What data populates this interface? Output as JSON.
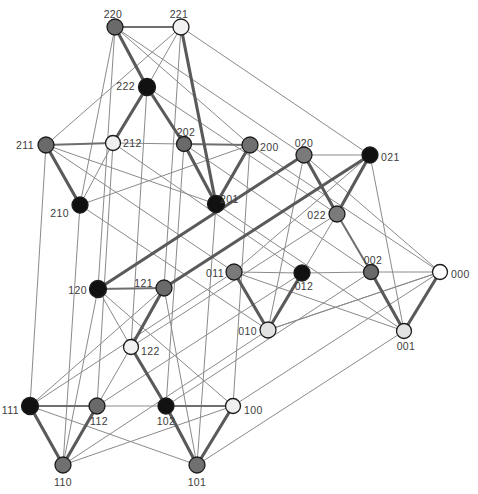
{
  "figure": {
    "width": 478,
    "height": 494,
    "background": "#ffffff"
  },
  "style": {
    "edge_strong_color": "#5a5a5a",
    "edge_medium_color": "#6e6e6e",
    "edge_thin_color": "#8a8a8a",
    "node_stroke": "#1c1c1c",
    "label_color": "#3c3c3c",
    "palette": {
      "black": "#111111",
      "dark_gray": "#6a6a6a",
      "mid_gray": "#909090",
      "light_gray": "#dcdcdc",
      "white": "#ffffff"
    }
  },
  "chart_data": {
    "type": "diagram",
    "subtype": "node-link-graph",
    "node_count": 27,
    "edge_count": 81,
    "label_scheme": "ternary-3-digit",
    "edge_rule": "vertices adjacent when labels differ in exactly one digit",
    "nodes": [
      {
        "id": "220",
        "label": "220",
        "x": 115,
        "y": 27,
        "r": 8.0,
        "fill": "#6a6a6a",
        "label_dx": -2,
        "label_dy": -12,
        "anchor": "middle"
      },
      {
        "id": "221",
        "label": "221",
        "x": 181,
        "y": 27,
        "r": 8.0,
        "fill": "#f2f2f2",
        "label_dx": -2,
        "label_dy": -12,
        "anchor": "middle"
      },
      {
        "id": "222",
        "label": "222",
        "x": 147,
        "y": 87,
        "r": 8.5,
        "fill": "#111111",
        "label_dx": -12,
        "label_dy": 0,
        "anchor": "end"
      },
      {
        "id": "211",
        "label": "211",
        "x": 46,
        "y": 145,
        "r": 8.0,
        "fill": "#6a6a6a",
        "label_dx": -12,
        "label_dy": 1,
        "anchor": "end"
      },
      {
        "id": "212",
        "label": "212",
        "x": 113,
        "y": 143,
        "r": 7.5,
        "fill": "#efefef",
        "label_dx": 10,
        "label_dy": 1,
        "anchor": "start"
      },
      {
        "id": "202",
        "label": "202",
        "x": 184,
        "y": 144,
        "r": 7.5,
        "fill": "#6a6a6a",
        "label_dx": 2,
        "label_dy": -11,
        "anchor": "middle"
      },
      {
        "id": "200",
        "label": "200",
        "x": 250,
        "y": 145,
        "r": 8.0,
        "fill": "#707070",
        "label_dx": 10,
        "label_dy": 3,
        "anchor": "start"
      },
      {
        "id": "020",
        "label": "020",
        "x": 304,
        "y": 155,
        "r": 8.0,
        "fill": "#7a7a7a",
        "label_dx": 0,
        "label_dy": -11,
        "anchor": "middle"
      },
      {
        "id": "021",
        "label": "021",
        "x": 370,
        "y": 155,
        "r": 8.0,
        "fill": "#111111",
        "label_dx": 11,
        "label_dy": 3,
        "anchor": "start"
      },
      {
        "id": "210",
        "label": "210",
        "x": 80,
        "y": 205,
        "r": 8.0,
        "fill": "#111111",
        "label_dx": -11,
        "label_dy": 9,
        "anchor": "end"
      },
      {
        "id": "201",
        "label": "201",
        "x": 216,
        "y": 204,
        "r": 8.5,
        "fill": "#111111",
        "label_dx": 4,
        "label_dy": -4,
        "anchor": "start"
      },
      {
        "id": "022",
        "label": "022",
        "x": 337,
        "y": 214,
        "r": 8.0,
        "fill": "#7a7a7a",
        "label_dx": -11,
        "label_dy": 2,
        "anchor": "end"
      },
      {
        "id": "011",
        "label": "011",
        "x": 234,
        "y": 272,
        "r": 8.0,
        "fill": "#7a7a7a",
        "label_dx": -10,
        "label_dy": 2,
        "anchor": "end"
      },
      {
        "id": "012",
        "label": "012",
        "x": 302,
        "y": 273,
        "r": 8.0,
        "fill": "#111111",
        "label_dx": 2,
        "label_dy": 14,
        "anchor": "middle"
      },
      {
        "id": "002",
        "label": "002",
        "x": 371,
        "y": 272,
        "r": 7.5,
        "fill": "#6a6a6a",
        "label_dx": 2,
        "label_dy": -11,
        "anchor": "middle"
      },
      {
        "id": "000",
        "label": "000",
        "x": 440,
        "y": 272,
        "r": 7.5,
        "fill": "#ffffff",
        "label_dx": 11,
        "label_dy": 3,
        "anchor": "start"
      },
      {
        "id": "120",
        "label": "120",
        "x": 98,
        "y": 289,
        "r": 8.5,
        "fill": "#111111",
        "label_dx": -11,
        "label_dy": 2,
        "anchor": "end"
      },
      {
        "id": "121",
        "label": "121",
        "x": 164,
        "y": 288,
        "r": 8.0,
        "fill": "#6a6a6a",
        "label_dx": -11,
        "label_dy": -4,
        "anchor": "end"
      },
      {
        "id": "010",
        "label": "010",
        "x": 268,
        "y": 330,
        "r": 8.0,
        "fill": "#e2e2e2",
        "label_dx": -11,
        "label_dy": 2,
        "anchor": "end"
      },
      {
        "id": "001",
        "label": "001",
        "x": 404,
        "y": 331,
        "r": 7.5,
        "fill": "#e2e2e2",
        "label_dx": 2,
        "label_dy": 16,
        "anchor": "middle"
      },
      {
        "id": "122",
        "label": "122",
        "x": 131,
        "y": 347,
        "r": 7.5,
        "fill": "#f2f2f2",
        "label_dx": 10,
        "label_dy": 5,
        "anchor": "start"
      },
      {
        "id": "111",
        "label": "111",
        "x": 30,
        "y": 406,
        "r": 8.5,
        "fill": "#111111",
        "label_dx": -11,
        "label_dy": 5,
        "anchor": "end"
      },
      {
        "id": "112",
        "label": "112",
        "x": 97,
        "y": 406,
        "r": 8.0,
        "fill": "#6a6a6a",
        "label_dx": 2,
        "label_dy": 16,
        "anchor": "middle"
      },
      {
        "id": "102",
        "label": "102",
        "x": 166,
        "y": 406,
        "r": 8.0,
        "fill": "#111111",
        "label_dx": 0,
        "label_dy": 16,
        "anchor": "middle"
      },
      {
        "id": "100",
        "label": "100",
        "x": 233,
        "y": 406,
        "r": 7.5,
        "fill": "#efefef",
        "label_dx": 11,
        "label_dy": 5,
        "anchor": "start"
      },
      {
        "id": "110",
        "label": "110",
        "x": 63,
        "y": 465,
        "r": 8.0,
        "fill": "#707070",
        "label_dx": 0,
        "label_dy": 18,
        "anchor": "middle"
      },
      {
        "id": "101",
        "label": "101",
        "x": 197,
        "y": 465,
        "r": 8.0,
        "fill": "#707070",
        "label_dx": 0,
        "label_dy": 18,
        "anchor": "middle"
      }
    ],
    "edges": [
      {
        "from": "000",
        "to": "001",
        "weight": "strong"
      },
      {
        "from": "000",
        "to": "002",
        "weight": "thin"
      },
      {
        "from": "000",
        "to": "010",
        "weight": "thin"
      },
      {
        "from": "000",
        "to": "020",
        "weight": "thin"
      },
      {
        "from": "000",
        "to": "100",
        "weight": "thin"
      },
      {
        "from": "000",
        "to": "200",
        "weight": "thin"
      },
      {
        "from": "001",
        "to": "002",
        "weight": "strong"
      },
      {
        "from": "001",
        "to": "011",
        "weight": "thin"
      },
      {
        "from": "001",
        "to": "021",
        "weight": "thin"
      },
      {
        "from": "001",
        "to": "101",
        "weight": "thin"
      },
      {
        "from": "001",
        "to": "201",
        "weight": "thin"
      },
      {
        "from": "002",
        "to": "012",
        "weight": "thin"
      },
      {
        "from": "002",
        "to": "022",
        "weight": "medium"
      },
      {
        "from": "002",
        "to": "102",
        "weight": "thin"
      },
      {
        "from": "002",
        "to": "202",
        "weight": "thin"
      },
      {
        "from": "010",
        "to": "011",
        "weight": "strong"
      },
      {
        "from": "010",
        "to": "012",
        "weight": "strong"
      },
      {
        "from": "010",
        "to": "000",
        "weight": "thin"
      },
      {
        "from": "010",
        "to": "020",
        "weight": "thin"
      },
      {
        "from": "010",
        "to": "110",
        "weight": "thin"
      },
      {
        "from": "010",
        "to": "210",
        "weight": "thin"
      },
      {
        "from": "011",
        "to": "012",
        "weight": "thin"
      },
      {
        "from": "011",
        "to": "021",
        "weight": "thin"
      },
      {
        "from": "011",
        "to": "111",
        "weight": "thin"
      },
      {
        "from": "011",
        "to": "211",
        "weight": "thin"
      },
      {
        "from": "012",
        "to": "022",
        "weight": "thin"
      },
      {
        "from": "012",
        "to": "112",
        "weight": "thin"
      },
      {
        "from": "012",
        "to": "212",
        "weight": "thin"
      },
      {
        "from": "020",
        "to": "021",
        "weight": "thin"
      },
      {
        "from": "020",
        "to": "022",
        "weight": "strong"
      },
      {
        "from": "020",
        "to": "120",
        "weight": "strong"
      },
      {
        "from": "020",
        "to": "220",
        "weight": "thin"
      },
      {
        "from": "021",
        "to": "022",
        "weight": "strong"
      },
      {
        "from": "021",
        "to": "121",
        "weight": "strong"
      },
      {
        "from": "021",
        "to": "221",
        "weight": "thin"
      },
      {
        "from": "022",
        "to": "122",
        "weight": "thin"
      },
      {
        "from": "022",
        "to": "222",
        "weight": "thin"
      },
      {
        "from": "100",
        "to": "101",
        "weight": "strong"
      },
      {
        "from": "100",
        "to": "102",
        "weight": "medium"
      },
      {
        "from": "100",
        "to": "110",
        "weight": "thin"
      },
      {
        "from": "100",
        "to": "120",
        "weight": "thin"
      },
      {
        "from": "100",
        "to": "200",
        "weight": "thin"
      },
      {
        "from": "101",
        "to": "102",
        "weight": "strong"
      },
      {
        "from": "101",
        "to": "111",
        "weight": "thin"
      },
      {
        "from": "101",
        "to": "121",
        "weight": "thin"
      },
      {
        "from": "101",
        "to": "201",
        "weight": "thin"
      },
      {
        "from": "102",
        "to": "112",
        "weight": "thin"
      },
      {
        "from": "102",
        "to": "122",
        "weight": "strong"
      },
      {
        "from": "102",
        "to": "202",
        "weight": "thin"
      },
      {
        "from": "110",
        "to": "111",
        "weight": "strong"
      },
      {
        "from": "110",
        "to": "112",
        "weight": "strong"
      },
      {
        "from": "110",
        "to": "120",
        "weight": "thin"
      },
      {
        "from": "110",
        "to": "210",
        "weight": "thin"
      },
      {
        "from": "111",
        "to": "112",
        "weight": "medium"
      },
      {
        "from": "111",
        "to": "121",
        "weight": "thin"
      },
      {
        "from": "111",
        "to": "211",
        "weight": "thin"
      },
      {
        "from": "112",
        "to": "122",
        "weight": "thin"
      },
      {
        "from": "112",
        "to": "212",
        "weight": "thin"
      },
      {
        "from": "120",
        "to": "121",
        "weight": "medium"
      },
      {
        "from": "120",
        "to": "122",
        "weight": "thin"
      },
      {
        "from": "120",
        "to": "220",
        "weight": "thin"
      },
      {
        "from": "121",
        "to": "122",
        "weight": "strong"
      },
      {
        "from": "121",
        "to": "221",
        "weight": "thin"
      },
      {
        "from": "122",
        "to": "222",
        "weight": "thin"
      },
      {
        "from": "200",
        "to": "201",
        "weight": "strong"
      },
      {
        "from": "200",
        "to": "202",
        "weight": "medium"
      },
      {
        "from": "200",
        "to": "210",
        "weight": "thin"
      },
      {
        "from": "200",
        "to": "220",
        "weight": "thin"
      },
      {
        "from": "201",
        "to": "202",
        "weight": "strong"
      },
      {
        "from": "201",
        "to": "211",
        "weight": "thin"
      },
      {
        "from": "201",
        "to": "221",
        "weight": "strong"
      },
      {
        "from": "202",
        "to": "212",
        "weight": "thin"
      },
      {
        "from": "202",
        "to": "222",
        "weight": "strong"
      },
      {
        "from": "210",
        "to": "211",
        "weight": "strong"
      },
      {
        "from": "210",
        "to": "212",
        "weight": "thin"
      },
      {
        "from": "210",
        "to": "220",
        "weight": "thin"
      },
      {
        "from": "211",
        "to": "212",
        "weight": "medium"
      },
      {
        "from": "211",
        "to": "221",
        "weight": "thin"
      },
      {
        "from": "212",
        "to": "222",
        "weight": "strong"
      },
      {
        "from": "220",
        "to": "221",
        "weight": "medium"
      },
      {
        "from": "220",
        "to": "222",
        "weight": "strong"
      },
      {
        "from": "221",
        "to": "222",
        "weight": "thin"
      }
    ]
  }
}
